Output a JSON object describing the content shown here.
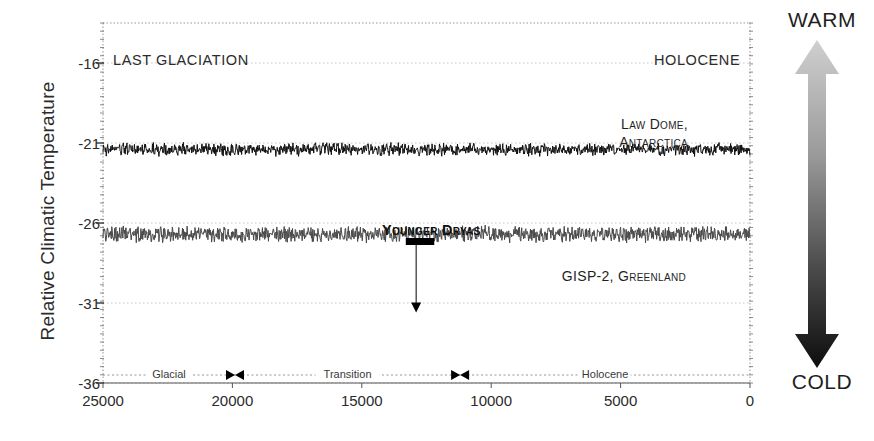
{
  "chart_data": {
    "type": "line",
    "title": "",
    "xlabel": "",
    "ylabel": "Relative Climatic Temperature",
    "xlim": [
      25000,
      0
    ],
    "ylim": [
      -36.0,
      -13.5
    ],
    "x_reversed": true,
    "grid": true,
    "legend_position": "in-plot annotations",
    "xticks": [
      25000,
      20000,
      15000,
      10000,
      5000,
      0
    ],
    "xtick_labels": [
      "25000",
      "20000",
      "15000",
      "10000",
      "5000",
      "0"
    ],
    "yticks": [
      -16,
      -21,
      -26,
      -31,
      -36
    ],
    "ytick_labels": [
      "-16",
      "-21",
      "-26",
      "-31",
      "-36"
    ],
    "gridlines_y": [
      -16,
      -21,
      -26,
      -31,
      -36
    ],
    "series": [
      {
        "name": "Law Dome, Antarctica",
        "color": "#111111",
        "noise_amplitude": 0.3,
        "x": [
          25000,
          24400,
          23800,
          23200,
          22600,
          22000,
          21400,
          20800,
          20200,
          19600,
          19000,
          18400,
          17800,
          17400,
          17000,
          16600,
          16200,
          15800,
          15400,
          15000,
          14600,
          14200,
          13800,
          13400,
          13000,
          12600,
          12200,
          11800,
          11400,
          11000,
          10600,
          10200,
          9800,
          9400,
          9000,
          8400,
          7800,
          7000,
          6200,
          5400,
          4600,
          3800,
          3000,
          2200,
          1400,
          700,
          0
        ],
        "y": [
          -28.7,
          -28.6,
          -28.5,
          -28.5,
          -28.4,
          -28.3,
          -28.2,
          -28.0,
          -28.1,
          -28.0,
          -27.9,
          -28.2,
          -28.1,
          -27.6,
          -26.9,
          -26.5,
          -26.3,
          -26.4,
          -26.2,
          -25.8,
          -25.4,
          -25.1,
          -24.6,
          -24.0,
          -23.5,
          -23.0,
          -22.6,
          -22.2,
          -21.8,
          -21.3,
          -21.0,
          -20.7,
          -20.6,
          -20.8,
          -21.0,
          -21.2,
          -21.2,
          -21.3,
          -21.3,
          -21.3,
          -21.4,
          -21.4,
          -21.4,
          -21.5,
          -21.4,
          -21.4,
          -21.4
        ]
      },
      {
        "name": "GISP-2, Greenland",
        "color": "#4a4a4a",
        "noise_amplitude": 0.38,
        "x": [
          25000,
          24500,
          24000,
          23500,
          23000,
          22600,
          22200,
          21800,
          21400,
          21000,
          20600,
          20200,
          19800,
          19400,
          19000,
          18600,
          18200,
          17800,
          17400,
          17000,
          16600,
          16200,
          15800,
          15400,
          15000,
          14800,
          14600,
          14400,
          14200,
          14000,
          13700,
          13400,
          13100,
          12800,
          12600,
          12400,
          12200,
          12000,
          11800,
          11600,
          11500,
          11400,
          11200,
          11000,
          10700,
          10400,
          10100,
          9800,
          9400,
          9000,
          8600,
          8200,
          7800,
          7400,
          7000,
          6400,
          5800,
          5200,
          4600,
          4000,
          3400,
          2800,
          2200,
          1600,
          1000,
          500,
          0
        ],
        "y": [
          -32.7,
          -32.9,
          -32.5,
          -32.8,
          -33.4,
          -33.6,
          -33.2,
          -32.8,
          -32.6,
          -33.0,
          -32.8,
          -33.3,
          -34.0,
          -34.1,
          -33.6,
          -31.0,
          -32.6,
          -33.2,
          -31.4,
          -32.3,
          -32.8,
          -32.9,
          -32.5,
          -32.7,
          -33.1,
          -32.9,
          -32.4,
          -32.0,
          -31.5,
          -31.1,
          -31.0,
          -31.2,
          -31.0,
          -29.5,
          -30.2,
          -31.0,
          -30.6,
          -31.4,
          -31.0,
          -31.9,
          -32.6,
          -33.3,
          -32.9,
          -33.6,
          -33.0,
          -31.0,
          -29.2,
          -28.2,
          -27.6,
          -27.1,
          -26.8,
          -26.6,
          -26.5,
          -26.4,
          -26.9,
          -26.5,
          -26.4,
          -26.5,
          -26.4,
          -26.5,
          -26.5,
          -26.6,
          -26.5,
          -26.6,
          -26.6,
          -26.7,
          -26.7
        ]
      }
    ],
    "annotations": [
      {
        "name": "last-glaciation",
        "text": "LAST GLACIATION"
      },
      {
        "name": "holocene",
        "text": "HOLOCENE"
      },
      {
        "name": "younger-dryas",
        "text": "Younger Dryas",
        "x_range": [
          13300,
          12200
        ],
        "pointer_x": 12900,
        "pointer_y": -31.6
      }
    ],
    "series_labels": [
      {
        "name": "law-dome",
        "line1": "Law Dome,",
        "line2": "Antarctica"
      },
      {
        "name": "gisp-2",
        "line1": "GISP-2, Greenland",
        "line2": ""
      }
    ],
    "phase_bar": {
      "segments": [
        {
          "label": "Glacial",
          "start": 25000,
          "end": 19900
        },
        {
          "label": "Transition",
          "start": 19900,
          "end": 11200
        },
        {
          "label": "Holocene",
          "start": 11200,
          "end": 0
        }
      ],
      "marker_positions": [
        19900,
        11200
      ]
    },
    "direction_scale": {
      "top_label": "WARM",
      "bottom_label": "COLD",
      "top_color": "#c9c9c9",
      "bottom_color": "#141414"
    }
  }
}
